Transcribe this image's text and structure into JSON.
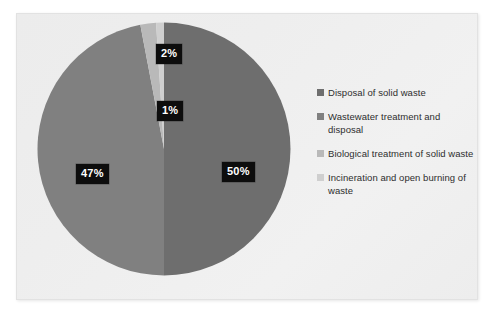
{
  "chart_data": {
    "type": "pie",
    "title": "",
    "subtitle": "",
    "xlabel": "",
    "ylabel": "",
    "grid": false,
    "legend_position": "right",
    "start_angle_clock": "12 o'clock",
    "direction": "clockwise",
    "categories": [
      "Disposal of solid waste",
      "Wastewater treatment and disposal",
      "Biological treatment of solid waste",
      "Incineration and open burning of waste"
    ],
    "values": [
      50,
      47,
      2,
      1
    ],
    "data_labels": [
      "50%",
      "47%",
      "2%",
      "1%"
    ],
    "units": "percent",
    "colors": [
      "#6e6e6e",
      "#808080",
      "#b9b9b9",
      "#cfcfcf"
    ],
    "slices": [
      {
        "label": "Disposal of solid waste",
        "value": 50,
        "data_label": "50%",
        "color": "#6e6e6e"
      },
      {
        "label": "Wastewater treatment and disposal",
        "value": 47,
        "data_label": "47%",
        "color": "#808080"
      },
      {
        "label": "Biological treatment of solid waste",
        "value": 2,
        "data_label": "2%",
        "color": "#b9b9b9"
      },
      {
        "label": "Incineration and open burning of waste",
        "value": 1,
        "data_label": "1%",
        "color": "#cfcfcf"
      }
    ]
  },
  "legend": {
    "items": [
      {
        "label": "Disposal of solid waste",
        "color": "#6e6e6e",
        "marker": "square-marker"
      },
      {
        "label": "Wastewater treatment and disposal",
        "color": "#808080",
        "marker": "square-marker"
      },
      {
        "label": "Biological treatment of solid waste",
        "color": "#b9b9b9",
        "marker": "square-marker"
      },
      {
        "label": "Incineration and open burning of waste",
        "color": "#cfcfcf",
        "marker": "square-marker"
      }
    ]
  },
  "labels": {
    "slice_50": "50%",
    "slice_47": "47%",
    "slice_2": "2%",
    "slice_1": "1%"
  },
  "style": {
    "frame_background": "#eeeeee",
    "frame_border": "#e2e2e2",
    "label_background": "#0d0d0d",
    "label_text": "#ffffff",
    "legend_text": "#2e2e2e"
  }
}
